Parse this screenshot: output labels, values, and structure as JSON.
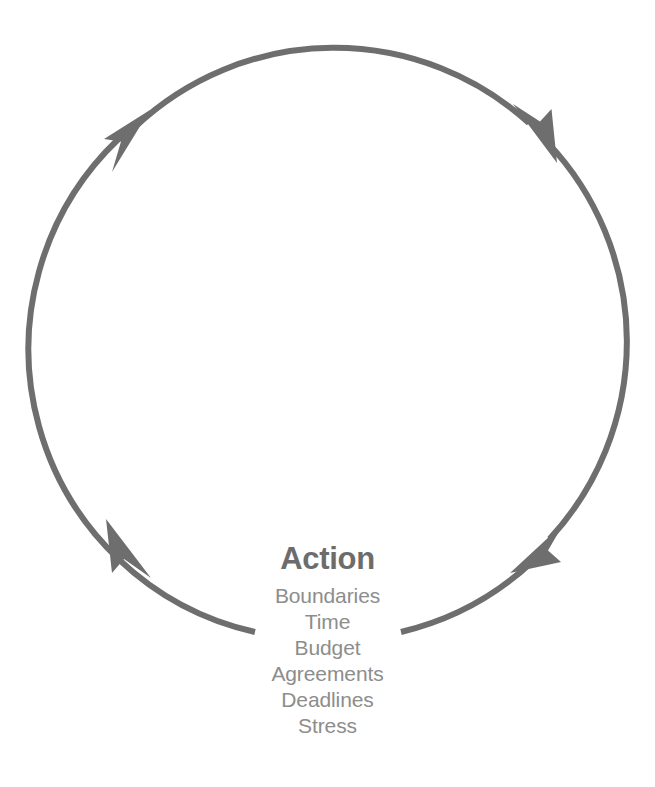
{
  "diagram": {
    "type": "cycle",
    "direction": "clockwise",
    "stroke_color": "#6e6e6e",
    "background_color": "#ffffff",
    "circle": {
      "center_x": 336,
      "center_y": 338,
      "radius": 290,
      "stroke_width": 6,
      "gap_bottom_degrees": 30
    },
    "arrowheads": [
      {
        "name": "arrowhead-top-left",
        "angle_deg": 225,
        "x": 126,
        "y": 130
      },
      {
        "name": "arrowhead-top-right",
        "angle_deg": 315,
        "x": 538,
        "y": 132
      },
      {
        "name": "arrowhead-bottom-right",
        "angle_deg": 45,
        "x": 540,
        "y": 550
      },
      {
        "name": "arrowhead-bottom-left",
        "angle_deg": 135,
        "x": 128,
        "y": 552
      }
    ],
    "title": "Action",
    "title_color": "#6c6c6c",
    "items_color": "#8d8d8d",
    "items": [
      "Boundaries",
      "Time",
      "Budget",
      "Agreements",
      "Deadlines",
      "Stress"
    ]
  }
}
